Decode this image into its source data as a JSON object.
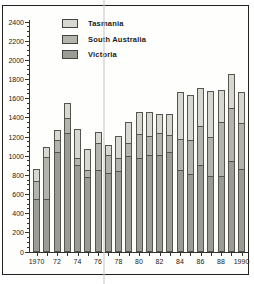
{
  "figure": {
    "background": "#ffffff",
    "frame_color": "#22221f",
    "artifact": "vertical-scan-line"
  },
  "legend": {
    "position": "top-left",
    "items": [
      {
        "label": "Tasmania",
        "color": "#d8d8d2"
      },
      {
        "label": "South Australia",
        "color": "#b4b4ae"
      },
      {
        "label": "Victoria",
        "color": "#9c9c96"
      }
    ]
  },
  "chart_data": {
    "type": "bar",
    "stacked": true,
    "title": "",
    "xlabel": "",
    "ylabel": "",
    "grid": false,
    "legend_position": "top-left",
    "ylim": [
      0,
      2400
    ],
    "ytick_step": 200,
    "ytick_minor_step": 50,
    "ytick_labels": [
      "0",
      "200",
      "400",
      "600",
      "800",
      "1000",
      "1200",
      "1400",
      "1600",
      "1800",
      "2000",
      "2200",
      "2400"
    ],
    "categories": [
      1970,
      1971,
      1972,
      1973,
      1974,
      1975,
      1976,
      1977,
      1978,
      1979,
      1980,
      1981,
      1982,
      1983,
      1984,
      1985,
      1986,
      1987,
      1988,
      1989,
      1990
    ],
    "xtick_labels": [
      "1970",
      "72",
      "74",
      "76",
      "78",
      "80",
      "82",
      "84",
      "86",
      "88",
      "1990"
    ],
    "series": [
      {
        "name": "Victoria",
        "color": "#9c9c96",
        "values": [
          545,
          545,
          1030,
          1230,
          900,
          770,
          850,
          810,
          830,
          990,
          970,
          1005,
          1000,
          1030,
          845,
          800,
          895,
          785,
          785,
          935,
          860
        ]
      },
      {
        "name": "South Australia",
        "color": "#b4b4ae",
        "values": [
          190,
          440,
          125,
          160,
          75,
          80,
          280,
          195,
          140,
          140,
          250,
          200,
          230,
          180,
          325,
          360,
          405,
          405,
          565,
          560,
          475
        ]
      },
      {
        "name": "Tasmania",
        "color": "#d8d8d2",
        "values": [
          135,
          115,
          115,
          160,
          305,
          220,
          120,
          115,
          240,
          230,
          240,
          255,
          210,
          230,
          495,
          480,
          410,
          490,
          340,
          365,
          335
        ]
      }
    ],
    "totals": [
      870,
      1100,
      1270,
      1550,
      1280,
      1070,
      1250,
      1120,
      1210,
      1360,
      1460,
      1460,
      1440,
      1440,
      1665,
      1640,
      1710,
      1680,
      1690,
      1860,
      1670
    ]
  }
}
